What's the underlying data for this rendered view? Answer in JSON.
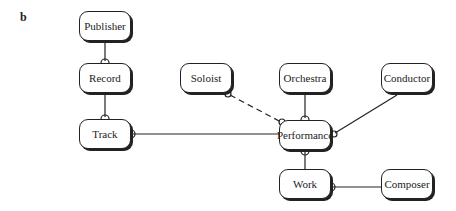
{
  "panel_label": "b",
  "entities": [
    {
      "id": "publisher",
      "label": "Publisher",
      "x": 79,
      "y": 11,
      "w": 52,
      "h": 30
    },
    {
      "id": "record",
      "label": "Record",
      "x": 79,
      "y": 63,
      "w": 52,
      "h": 30
    },
    {
      "id": "track",
      "label": "Track",
      "x": 79,
      "y": 119,
      "w": 52,
      "h": 30
    },
    {
      "id": "soloist",
      "label": "Soloist",
      "x": 180,
      "y": 63,
      "w": 52,
      "h": 30
    },
    {
      "id": "orchestra",
      "label": "Orchestra",
      "x": 279,
      "y": 63,
      "w": 52,
      "h": 30
    },
    {
      "id": "conductor",
      "label": "Conductor",
      "x": 381,
      "y": 63,
      "w": 52,
      "h": 30
    },
    {
      "id": "performance",
      "label": "Performance",
      "x": 279,
      "y": 120,
      "w": 52,
      "h": 30
    },
    {
      "id": "work",
      "label": "Work",
      "x": 279,
      "y": 169,
      "w": 52,
      "h": 30
    },
    {
      "id": "composer",
      "label": "Composer",
      "x": 381,
      "y": 169,
      "w": 52,
      "h": 30
    }
  ],
  "relationships": [
    {
      "from": "publisher",
      "to": "record",
      "style": "solid",
      "many_end": "record"
    },
    {
      "from": "record",
      "to": "track",
      "style": "solid",
      "many_end": "track"
    },
    {
      "from": "track",
      "to": "performance",
      "style": "solid",
      "many_end": "track"
    },
    {
      "from": "soloist",
      "to": "performance",
      "style": "dashed",
      "many_end": "both"
    },
    {
      "from": "orchestra",
      "to": "performance",
      "style": "solid",
      "many_end": "performance"
    },
    {
      "from": "conductor",
      "to": "performance",
      "style": "solid",
      "many_end": "performance"
    },
    {
      "from": "performance",
      "to": "work",
      "style": "solid",
      "many_end": "performance"
    },
    {
      "from": "work",
      "to": "composer",
      "style": "solid",
      "many_end": "work"
    }
  ]
}
